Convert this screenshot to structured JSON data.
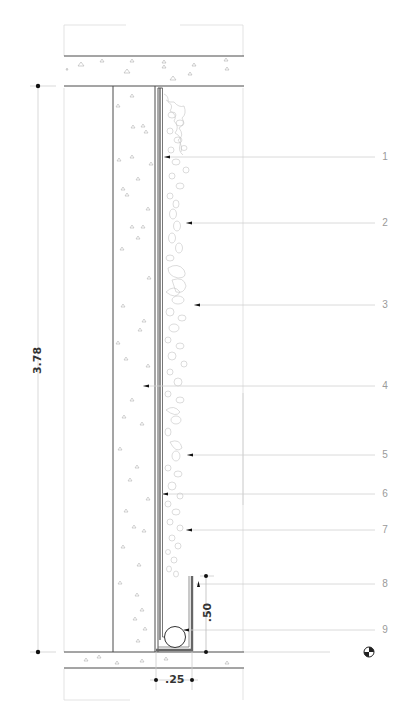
{
  "drawing": {
    "type": "architectural-section",
    "subject": "vertical green wall detail",
    "colors": {
      "line": "#4a4a4a",
      "thin_line": "#c8c8c8",
      "leader": "#d0d0d0",
      "callout_text": "#9a9a9a",
      "dim_text": "#333333",
      "hatch": "#b0b0b0",
      "vegetation": "#bdbdbd"
    }
  },
  "dimensions": {
    "overall_height": "3.78",
    "upstand_height": ".50",
    "channel_width": ".25"
  },
  "callouts": [
    {
      "number": "1",
      "y": 157
    },
    {
      "number": "2",
      "y": 223
    },
    {
      "number": "3",
      "y": 305
    },
    {
      "number": "4",
      "y": 386
    },
    {
      "number": "5",
      "y": 455
    },
    {
      "number": "6",
      "y": 494
    },
    {
      "number": "7",
      "y": 530
    },
    {
      "number": "8",
      "y": 584
    },
    {
      "number": "9",
      "y": 630
    }
  ],
  "level_marker": {
    "icon": "level-datum-icon"
  }
}
